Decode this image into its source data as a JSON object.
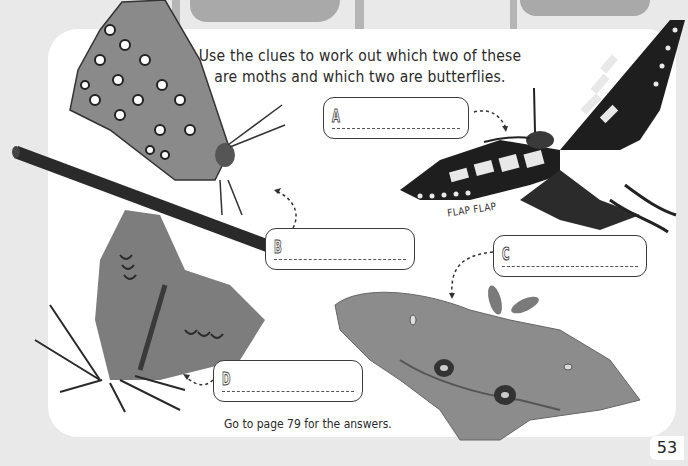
{
  "page": {
    "title_lines": [
      "Use the clues to work out which two of these",
      "are moths and which two are butterflies."
    ],
    "footer_note": "Go to page 79 for the answers.",
    "page_number": "53",
    "sound_effect": "FLAP FLAP"
  },
  "answer_boxes": [
    {
      "letter": "A",
      "value": "",
      "points_to": "swallowtail-butterfly"
    },
    {
      "letter": "B",
      "value": "",
      "points_to": "blue-butterfly-on-pencil"
    },
    {
      "letter": "C",
      "value": "",
      "points_to": "polyphemus-moth"
    },
    {
      "letter": "D",
      "value": "",
      "points_to": "grey-moth"
    }
  ],
  "images": [
    {
      "name": "blue-butterfly-on-pencil",
      "label": "Butterfly perched on a pencil"
    },
    {
      "name": "swallowtail-butterfly",
      "label": "Swallowtail"
    },
    {
      "name": "grey-moth",
      "label": "Moth with folded wings"
    },
    {
      "name": "polyphemus-moth",
      "label": "Large eyespot moth"
    }
  ],
  "colors": {
    "background": "#e9e9e9",
    "panel": "#ffffff",
    "top_shapes": "#a9a9a9",
    "text": "#2a2a2a"
  }
}
